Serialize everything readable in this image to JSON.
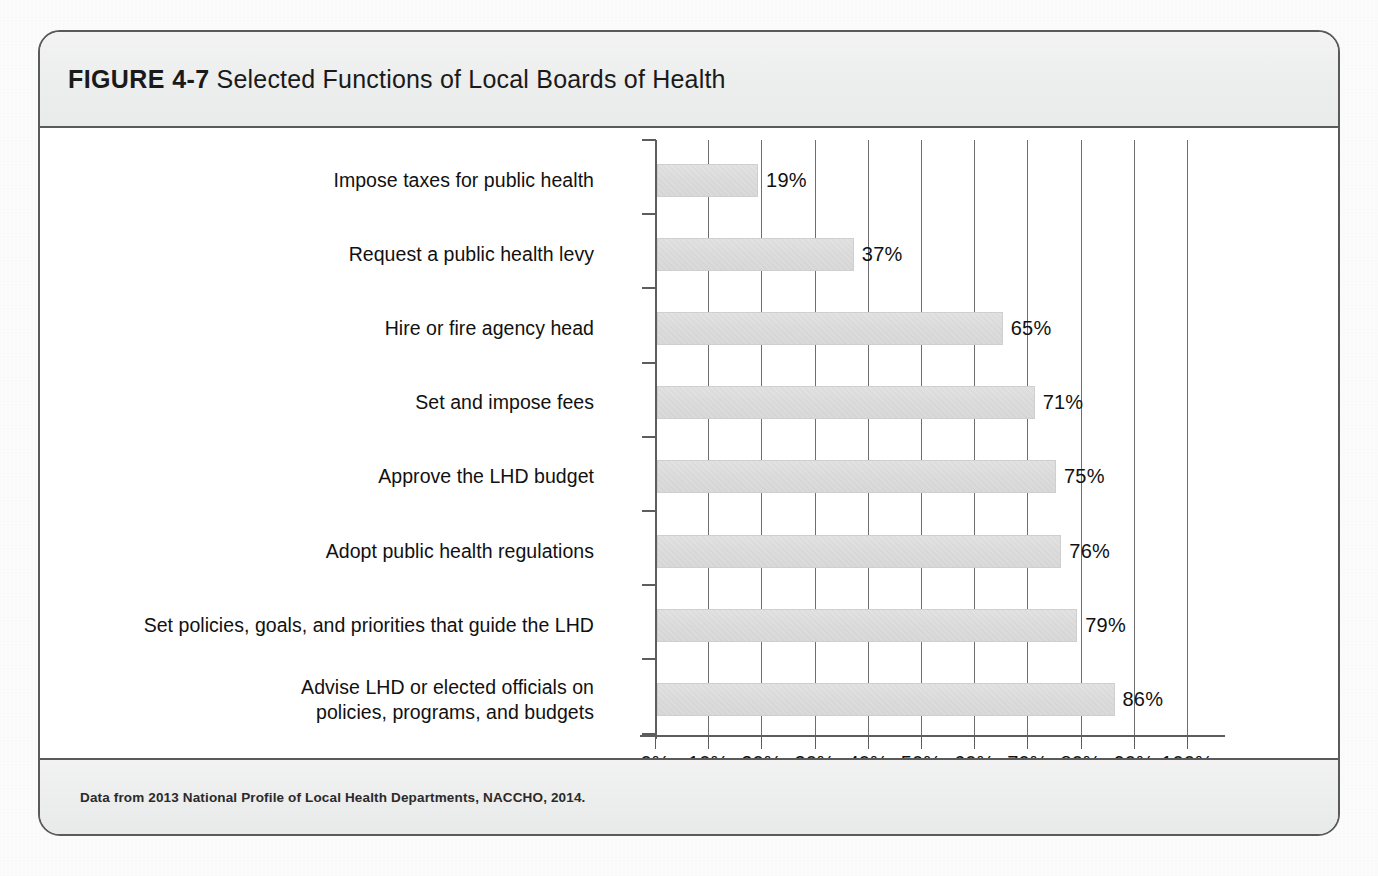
{
  "figure": {
    "number_label": "FIGURE 4-7",
    "caption": "Selected Functions of Local Boards of Health",
    "source": "Data from 2013 National Profile of Local Health Departments, NACCHO, 2014.",
    "border_color": "#5a5a5a",
    "header_band_color": "#eceded",
    "bar_color": "#dcdcdc"
  },
  "chart_data": {
    "type": "bar",
    "orientation": "horizontal",
    "title": "Selected Functions of Local Boards of Health",
    "xlabel": "",
    "ylabel": "",
    "xlim": [
      0,
      100
    ],
    "grid": true,
    "legend": "none",
    "value_label_suffix": "%",
    "xtick_labels": [
      "0%",
      "10%",
      "20%",
      "30%",
      "40%",
      "50%",
      "60%",
      "70%",
      "80%",
      "90%",
      "100%"
    ],
    "xticks": [
      0,
      10,
      20,
      30,
      40,
      50,
      60,
      70,
      80,
      90,
      100
    ],
    "categories": [
      "Impose taxes for public health",
      "Request a public health levy",
      "Hire or fire agency head",
      "Set and impose fees",
      "Approve the LHD budget",
      "Adopt public health regulations",
      "Set policies, goals, and priorities that guide the LHD",
      "Advise LHD or elected officials on\npolicies, programs, and budgets"
    ],
    "values": [
      19,
      37,
      65,
      71,
      75,
      76,
      79,
      86
    ],
    "value_labels": [
      "19%",
      "37%",
      "65%",
      "71%",
      "75%",
      "76%",
      "79%",
      "86%"
    ]
  }
}
